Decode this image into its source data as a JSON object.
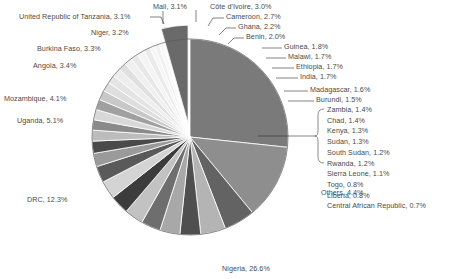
{
  "chart_data": {
    "type": "pie",
    "title": "",
    "xlabel": "",
    "ylabel": "",
    "units": "percent",
    "legend_position": "none",
    "labels_inline": true,
    "total_percent": 100.0,
    "center": {
      "x": 190,
      "y": 137
    },
    "radius": 98,
    "start_angle_deg": -90,
    "direction": "clockwise",
    "exploded_slices": [
      "Others"
    ],
    "bracket_group": {
      "leader": "horizontal-line-to-brace",
      "members": [
        "Zambia",
        "Chad",
        "Kenya",
        "Sudan",
        "South Sudan",
        "Rwanda",
        "Sierra Leone",
        "Togo",
        "Liberia",
        "Central African Republic"
      ]
    },
    "categories": [
      "Nigeria",
      "DRC",
      "Uganda",
      "Mozambique",
      "Angola",
      "Burkina Faso",
      "Niger",
      "United Republic of Tanzania",
      "Mali",
      "Côte d'Ivoire",
      "Cameroon",
      "Ghana",
      "Benin",
      "Guinea",
      "Malawi",
      "Ethiopia",
      "India",
      "Madagascar",
      "Burundi",
      "Zambia",
      "Chad",
      "Kenya",
      "Sudan",
      "South Sudan",
      "Rwanda",
      "Sierra Leone",
      "Togo",
      "Liberia",
      "Central African Republic",
      "Others"
    ],
    "values": [
      26.6,
      12.3,
      5.1,
      4.1,
      3.4,
      3.3,
      3.2,
      3.1,
      3.1,
      3.0,
      2.7,
      2.2,
      2.0,
      1.8,
      1.7,
      1.7,
      1.7,
      1.6,
      1.5,
      1.4,
      1.4,
      1.3,
      1.3,
      1.2,
      1.2,
      1.1,
      0.8,
      0.8,
      0.7,
      4.4
    ],
    "colors": [
      "#7a7a7a",
      "#8e8e8e",
      "#636363",
      "#b4b4b4",
      "#4f4f4f",
      "#a8a8a8",
      "#6e6e6e",
      "#c2c2c2",
      "#3c3c3c",
      "#d4d4d4",
      "#5a5a5a",
      "#9a9a9a",
      "#4a4a4a",
      "#bcbcbc",
      "#8a8a8a",
      "#d8d8d8",
      "#a0a0a0",
      "#c8c8c8",
      "#dedede",
      "#e4e4e4",
      "#ededed",
      "#e0e0e0",
      "#f0f0f0",
      "#e8e8e8",
      "#f4f4f4",
      "#ebebeb",
      "#f6f6f6",
      "#f1f1f1",
      "#f8f8f8",
      "#6a6a6a"
    ],
    "slice_labels": [
      {
        "name": "Mali",
        "pct": "3.1%",
        "text": "Mali, 3.1%",
        "align": "left",
        "x": 153,
        "y": 3,
        "leader": "tick-down"
      },
      {
        "name": "Côte d'Ivoire",
        "pct": "3.0%",
        "text": "Côte d'Ivoire, 3.0%",
        "align": "left",
        "x": 210,
        "y": 3,
        "leader": "hook-left"
      },
      {
        "name": "Cameroon",
        "pct": "2.7%",
        "text": "Cameroon, 2.7%",
        "align": "left",
        "x": 226,
        "y": 13,
        "leader": "hook-left"
      },
      {
        "name": "Ghana",
        "pct": "2.2%",
        "text": "Ghana, 2.2%",
        "align": "left",
        "x": 238,
        "y": 23,
        "leader": "hook-left"
      },
      {
        "name": "Benin",
        "pct": "2.0%",
        "text": "Benin, 2.0%",
        "align": "left",
        "x": 246,
        "y": 33,
        "leader": "hook-left"
      },
      {
        "name": "Guinea",
        "pct": "1.8%",
        "text": "Guinea, 1.8%",
        "align": "left",
        "x": 284,
        "y": 43,
        "leader": "dash-left"
      },
      {
        "name": "Malawi",
        "pct": "1.7%",
        "text": "Malawi, 1.7%",
        "align": "left",
        "x": 288,
        "y": 53,
        "leader": "dash-left"
      },
      {
        "name": "Ethiopia",
        "pct": "1.7%",
        "text": "Ethiopia, 1.7%",
        "align": "left",
        "x": 296,
        "y": 63,
        "leader": "dash-left"
      },
      {
        "name": "India",
        "pct": "1.7%",
        "text": "India, 1.7%",
        "align": "left",
        "x": 300,
        "y": 73,
        "leader": "dash-left"
      },
      {
        "name": "Madagascar",
        "pct": "1.6%",
        "text": "Madagascar, 1.6%",
        "align": "left",
        "x": 310,
        "y": 86,
        "leader": "dash-left"
      },
      {
        "name": "Burundi",
        "pct": "1.5%",
        "text": "Burundi, 1.5%",
        "align": "left",
        "x": 316,
        "y": 96,
        "leader": "dash-left"
      },
      {
        "name": "Others",
        "pct": "4.4%",
        "text": "Others, 4.4%",
        "align": "left",
        "x": 321,
        "y": 189,
        "leader": "none"
      },
      {
        "name": "Nigeria",
        "pct": "26.6%",
        "text": "Nigeria, 26.6%",
        "align": "left",
        "x": 222,
        "y": 265,
        "leader": "none"
      },
      {
        "name": "DRC",
        "pct": "12.3%",
        "text": "DRC, 12.3%",
        "align": "right",
        "x": 27,
        "y": 196,
        "leader": "none"
      },
      {
        "name": "Uganda",
        "pct": "5.1%",
        "text": "Uganda, 5.1%",
        "align": "right",
        "x": 17,
        "y": 117,
        "leader": "none"
      },
      {
        "name": "Mozambique",
        "pct": "4.1%",
        "text": "Mozambique, 4.1%",
        "align": "right",
        "x": 4,
        "y": 95,
        "leader": "none"
      },
      {
        "name": "Angola",
        "pct": "3.4%",
        "text": "Angola, 3.4%",
        "align": "right",
        "x": 33,
        "y": 62,
        "leader": "none"
      },
      {
        "name": "Burkina Faso",
        "pct": "3.3%",
        "text": "Burkina Faso, 3.3%",
        "align": "right",
        "x": 37,
        "y": 45,
        "leader": "none"
      },
      {
        "name": "Niger",
        "pct": "3.2%",
        "text": "Niger, 3.2%",
        "align": "right",
        "x": 91,
        "y": 29,
        "leader": "none"
      },
      {
        "name": "United Republic of Tanzania",
        "pct": "3.1%",
        "text": "United Republic of Tanzania, 3.1%",
        "align": "right",
        "x": 19,
        "y": 13,
        "leader": "hook-right"
      }
    ],
    "bracket_labels": [
      {
        "name": "Zambia",
        "pct": "1.4%",
        "text": "Zambia, 1.4%"
      },
      {
        "name": "Chad",
        "pct": "1.4%",
        "text": "Chad, 1.4%"
      },
      {
        "name": "Kenya",
        "pct": "1.3%",
        "text": "Kenya, 1.3%"
      },
      {
        "name": "Sudan",
        "pct": "1.3%",
        "text": "Sudan, 1.3%"
      },
      {
        "name": "South Sudan",
        "pct": "1.2%",
        "text": "South Sudan, 1.2%"
      },
      {
        "name": "Rwanda",
        "pct": "1.2%",
        "text": "Rwanda, 1.2%"
      },
      {
        "name": "Sierra Leone",
        "pct": "1.1%",
        "text": "Sierra Leone, 1.1%"
      },
      {
        "name": "Togo",
        "pct": "0.8%",
        "text": "Togo, 0.8%"
      },
      {
        "name": "Liberia",
        "pct": "0.8%",
        "text": "Liberia, 0.8%"
      },
      {
        "name": "Central African Republic",
        "pct": "0.7%",
        "text": "Central African Republic, 0.7%"
      }
    ]
  }
}
